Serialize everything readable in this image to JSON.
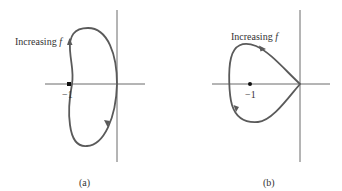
{
  "panels": [
    {
      "id": "a",
      "caption": "(a)",
      "annotation": {
        "text": "Increasing ",
        "variable": "f"
      },
      "critical_point_label": "−1",
      "critical_point_value": -1,
      "curve_shape": "kidney-shaped closed contour left of imaginary axis, passing through origin; encircles -1",
      "direction_arrows": [
        "upward on left branch",
        "downward on right branch"
      ]
    },
    {
      "id": "b",
      "caption": "(b)",
      "annotation": {
        "text": "Increasing ",
        "variable": "f"
      },
      "critical_point_label": "−1",
      "critical_point_value": -1,
      "curve_shape": "heart-shaped closed contour with cusp at origin; encircles -1",
      "direction_arrows": [
        "clockwise on upper branch",
        "on lower-left branch"
      ]
    }
  ],
  "colors": {
    "curve": "#5a5a5a",
    "axis": "#6a6a6a",
    "point": "#111111",
    "text": "#333333"
  }
}
